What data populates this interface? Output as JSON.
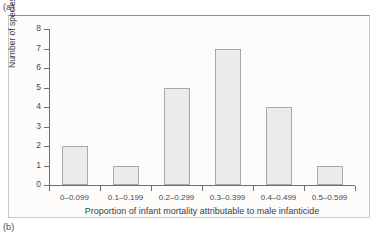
{
  "figure": {
    "panel_a_label": "(a)",
    "panel_b_label": "(b)"
  },
  "chart_data": {
    "type": "bar",
    "title": "",
    "subtitle": "",
    "categories": [
      "0–0.099",
      "0.1–0.199",
      "0.2–0.299",
      "0.3–0.399",
      "0.4–0.499",
      "0.5–0.599"
    ],
    "values": [
      2,
      1,
      5,
      7,
      4,
      1
    ],
    "xlabel": "Proportion of infant mortality attributable to male infanticide",
    "ylabel": "Number of species",
    "ylim": [
      0,
      8
    ],
    "yticks": [
      0,
      1,
      2,
      3,
      4,
      5,
      6,
      7,
      8
    ],
    "ytick_labels": [
      "0",
      "1",
      "2",
      "3",
      "4",
      "5",
      "6",
      "7",
      "8"
    ],
    "grid": false,
    "legend": null,
    "bar_fill_color": "#ebebeb",
    "bar_edge_color": "#a8a8a8",
    "axis_color": "#6f6f6f",
    "panel_background": "#fdfcfb"
  }
}
